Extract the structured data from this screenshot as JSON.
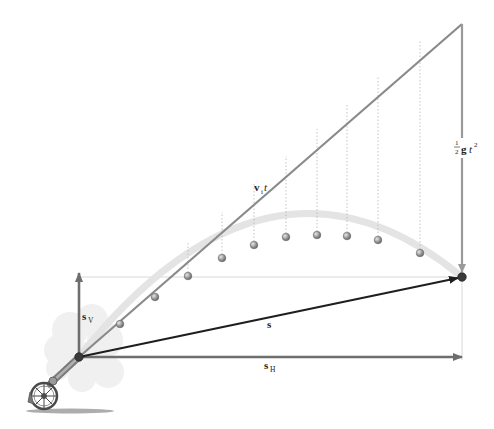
{
  "diagram": {
    "type": "projectile-motion-vector-diagram",
    "labels": {
      "velocity_displacement": {
        "vector": "v",
        "subscript": "i",
        "suffix": "t"
      },
      "gravity_drop": {
        "coefficient_num": "1",
        "coefficient_den": "2",
        "vector": "g",
        "var": "t",
        "exponent": "2"
      },
      "displacement": {
        "vector": "s"
      },
      "horizontal_displacement": {
        "vector": "s",
        "subscript": "H"
      },
      "vertical_displacement": {
        "vector": "s",
        "subscript": "V"
      }
    },
    "colors": {
      "velocity_line": "#8a8a8a",
      "trajectory_band": "#e4e4e4",
      "displacement_arrow": "#1e1e1e",
      "component_arrows": "#6e6e6e",
      "dotted_drops": "#b5b5b5",
      "guide_lines": "#d8d8d8",
      "ball": "#9a9a9a",
      "smoke": "#eeeeee"
    },
    "points": {
      "origin": [
        79,
        357
      ],
      "velocity_end": [
        462,
        24
      ],
      "landing": [
        462,
        277
      ],
      "horizontal_end": [
        462,
        357
      ],
      "vertical_end": [
        79,
        273
      ]
    },
    "balls": [
      [
        120,
        324
      ],
      [
        155,
        297
      ],
      [
        188,
        276
      ],
      [
        222,
        258
      ],
      [
        254,
        245
      ],
      [
        286,
        237
      ],
      [
        317,
        235
      ],
      [
        347,
        236
      ],
      [
        378,
        240
      ],
      [
        420,
        253
      ]
    ],
    "drop_lines": [
      [
        188,
        276,
        188,
        241
      ],
      [
        222,
        258,
        222,
        212
      ],
      [
        254,
        245,
        254,
        184
      ],
      [
        286,
        237,
        286,
        156
      ],
      [
        317,
        235,
        317,
        129
      ],
      [
        347,
        236,
        347,
        103
      ],
      [
        378,
        240,
        378,
        76
      ],
      [
        420,
        253,
        420,
        60
      ]
    ]
  }
}
